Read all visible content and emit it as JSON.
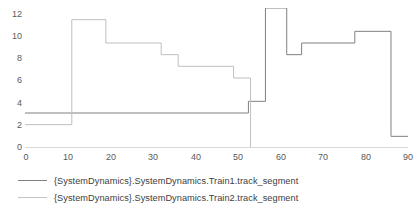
{
  "chart_data": {
    "type": "line",
    "title": "",
    "xlabel": "",
    "ylabel": "",
    "xlim": [
      0,
      90
    ],
    "ylim": [
      0,
      12
    ],
    "grid": false,
    "step_style": "post",
    "legend_position": "bottom-left",
    "xticks": [
      0,
      10,
      20,
      30,
      40,
      50,
      60,
      70,
      80,
      90
    ],
    "yticks": [
      0,
      2,
      4,
      6,
      8,
      10,
      12
    ],
    "series": [
      {
        "name": "{SystemDynamics}.SystemDynamics.Train1.track_segment",
        "color": "#808080",
        "points": [
          [
            0,
            3
          ],
          [
            52.5,
            3
          ],
          [
            52.5,
            4
          ],
          [
            56.5,
            4
          ],
          [
            56.5,
            12
          ],
          [
            61.5,
            12
          ],
          [
            61.5,
            8
          ],
          [
            65,
            8
          ],
          [
            65,
            9
          ],
          [
            77.5,
            9
          ],
          [
            77.5,
            10
          ],
          [
            86,
            10
          ],
          [
            86,
            1
          ],
          [
            90,
            1
          ]
        ]
      },
      {
        "name": "{SystemDynamics}.SystemDynamics.Train2.track_segment",
        "color": "#bfbfbf",
        "points": [
          [
            0,
            2
          ],
          [
            11,
            2
          ],
          [
            11,
            11
          ],
          [
            19,
            11
          ],
          [
            19,
            9
          ],
          [
            32,
            9
          ],
          [
            32,
            8
          ],
          [
            36,
            8
          ],
          [
            36,
            7
          ],
          [
            49,
            7
          ],
          [
            49,
            6
          ],
          [
            53,
            6
          ],
          [
            53,
            0
          ]
        ]
      }
    ]
  },
  "axes": {
    "y_labels": [
      "12",
      "10",
      "8",
      "6",
      "4",
      "2",
      "0"
    ],
    "x_labels": [
      "0",
      "10",
      "20",
      "30",
      "40",
      "50",
      "60",
      "70",
      "80",
      "90"
    ]
  },
  "legend": {
    "items": [
      {
        "label": "{SystemDynamics}.SystemDynamics.Train1.track_segment",
        "color": "#808080"
      },
      {
        "label": "{SystemDynamics}.SystemDynamics.Train2.track_segment",
        "color": "#c4c4c4"
      }
    ]
  },
  "style": {
    "axis_color": "#d0d0d0",
    "tick_text_color": "#595959",
    "legend_text_color": "#404040",
    "background": "#ffffff"
  }
}
